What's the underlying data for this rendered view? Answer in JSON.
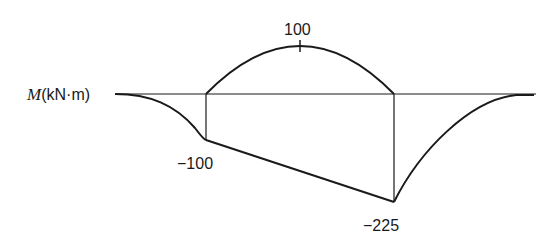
{
  "diagram": {
    "type": "bending-moment-diagram",
    "axis_label": {
      "symbol": "M",
      "units": "(kN·m)"
    },
    "values": {
      "positive_peak": "100",
      "left_support": "−100",
      "right_support": "−225"
    },
    "line_color": "#1a1a1a"
  }
}
